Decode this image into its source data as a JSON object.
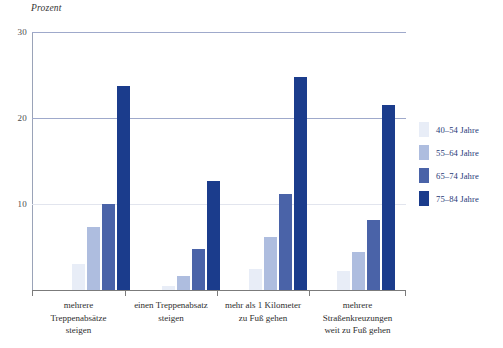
{
  "chart_data": {
    "type": "bar",
    "title": "",
    "ylabel": "Prozent",
    "xlabel": "",
    "ylim": [
      0,
      30
    ],
    "yticks": [
      0,
      10,
      20,
      30
    ],
    "ytick_labels": [
      "0",
      "10",
      "20",
      "30"
    ],
    "grid": true,
    "legend_position": "right",
    "categories": [
      "mehrere\nTreppenabsätze\nsteigen",
      "einen Treppenabsatz\nsteigen",
      "mehr als 1 Kilometer\nzu Fuß gehen",
      "mehrere\nStraßenkreuzungen\nweit zu Fuß gehen"
    ],
    "series": [
      {
        "name": "40–54 Jahre",
        "color": "#e8edf7",
        "values": [
          3.0,
          0.5,
          2.4,
          2.2
        ]
      },
      {
        "name": "55–64 Jahre",
        "color": "#aebddf",
        "values": [
          7.3,
          1.6,
          6.2,
          4.4
        ]
      },
      {
        "name": "65–74 Jahre",
        "color": "#4a63a8",
        "values": [
          10.0,
          4.8,
          11.2,
          8.1
        ]
      },
      {
        "name": "75–84 Jahre",
        "color": "#1b3c8c",
        "values": [
          23.7,
          12.7,
          24.8,
          21.5
        ]
      }
    ]
  },
  "axis": {
    "y_title": "Prozent"
  },
  "categories_display": [
    {
      "lines": [
        "mehrere",
        "Treppenabsätze",
        "steigen"
      ]
    },
    {
      "lines": [
        "einen Treppenabsatz",
        "steigen"
      ]
    },
    {
      "lines": [
        "mehr als 1 Kilometer",
        "zu Fuß gehen"
      ]
    },
    {
      "lines": [
        "mehrere",
        "Straßenkreuzungen",
        "weit zu Fuß gehen"
      ]
    }
  ],
  "legend": {
    "items": [
      {
        "label": "40–54 Jahre",
        "color": "#e8edf7"
      },
      {
        "label": "55–64 Jahre",
        "color": "#aebddf"
      },
      {
        "label": "65–74 Jahre",
        "color": "#4a63a8"
      },
      {
        "label": "75–84 Jahre",
        "color": "#1b3c8c"
      }
    ]
  },
  "colors": {
    "gridline_major": "#9fa9cb",
    "gridline_minor": "#e2e5ee",
    "axis": "#7b7b7b",
    "legend_text": "#1f3a78"
  }
}
